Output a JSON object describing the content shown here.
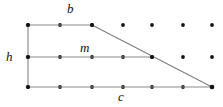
{
  "figure": {
    "width": 223,
    "height": 107,
    "background_color": "#ffffff",
    "line_color": "#8a8a8a",
    "dot_color": "#141414",
    "label_color": "#111111"
  },
  "labels": {
    "top_base": "b",
    "height": "h",
    "midsegment": "m",
    "bottom_base": "c"
  },
  "grid": {
    "columns": 7,
    "rows": 3,
    "x_positions": [
      28,
      60,
      92,
      123,
      152,
      183,
      212
    ],
    "y_positions": [
      25,
      57,
      87
    ],
    "dot_radius": 1.9
  },
  "shape": {
    "type": "trapezoid",
    "vertices": {
      "top_left": [
        28,
        25
      ],
      "top_right": [
        92,
        25
      ],
      "bottom_left": [
        28,
        87
      ],
      "bottom_right": [
        212,
        87
      ]
    },
    "edges": [
      {
        "name": "top-base-b",
        "from": [
          28,
          25
        ],
        "to": [
          92,
          25
        ]
      },
      {
        "name": "left-height-h",
        "from": [
          28,
          25
        ],
        "to": [
          28,
          87
        ]
      },
      {
        "name": "bottom-base-c",
        "from": [
          28,
          87
        ],
        "to": [
          212,
          87
        ]
      },
      {
        "name": "diagonal-leg",
        "from": [
          92,
          25
        ],
        "to": [
          212,
          87
        ]
      },
      {
        "name": "midsegment-m",
        "from": [
          28,
          57
        ],
        "to": [
          152,
          57
        ]
      }
    ],
    "marked_points": [
      [
        28,
        25
      ],
      [
        60,
        25
      ],
      [
        92,
        25
      ],
      [
        28,
        57
      ],
      [
        60,
        57
      ],
      [
        92,
        57
      ],
      [
        123,
        57
      ],
      [
        152,
        57
      ],
      [
        28,
        87
      ],
      [
        60,
        87
      ],
      [
        92,
        87
      ],
      [
        123,
        87
      ],
      [
        152,
        87
      ],
      [
        183,
        87
      ],
      [
        212,
        87
      ]
    ]
  }
}
